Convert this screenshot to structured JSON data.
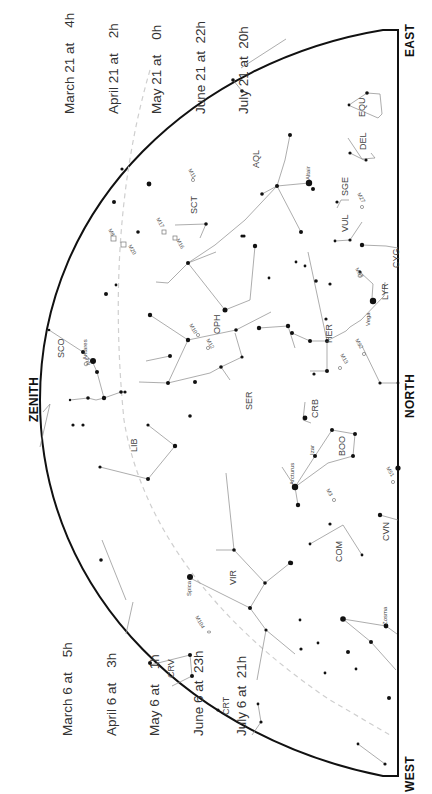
{
  "chart_title": "Star chart — south-facing summer sky (rotated)",
  "directions": {
    "zenith": "ZENITH",
    "north": "NORTH",
    "east": "EAST",
    "west": "WEST"
  },
  "time_blocks": {
    "upper": [
      "March 21 at    4h",
      "April 21 at    2h",
      "May 21 at    0h",
      "June 21 at  22h",
      "July 21 at  20h"
    ],
    "lower": [
      "March 6 at    5h",
      "April 6 at    3h",
      "May 6 at    1h",
      "June 6 at  23h",
      "July 6 at  21h"
    ]
  },
  "colors": {
    "horizon": "#111111",
    "constellation_line": "#8a8a8a",
    "star": "#111111",
    "ecliptic": "#cfcfcf",
    "label": "#444444"
  },
  "constellations": [
    {
      "abbr": "SCO",
      "x": 60,
      "y": 358
    },
    {
      "abbr": "LIB",
      "x": 137,
      "y": 445
    },
    {
      "abbr": "SCT",
      "x": 193,
      "y": 206
    },
    {
      "abbr": "OPH",
      "x": 216,
      "y": 327
    },
    {
      "abbr": "SER",
      "x": 248,
      "y": 403
    },
    {
      "abbr": "AQL",
      "x": 255,
      "y": 162
    },
    {
      "abbr": "SGE",
      "x": 346,
      "y": 200
    },
    {
      "abbr": "VUL",
      "x": 344,
      "y": 225
    },
    {
      "abbr": "DEL",
      "x": 362,
      "y": 148
    },
    {
      "abbr": "EQU",
      "x": 361,
      "y": 113
    },
    {
      "abbr": "LYR",
      "x": 384,
      "y": 295
    },
    {
      "abbr": "CYG",
      "x": 396,
      "y": 258
    },
    {
      "abbr": "HER",
      "x": 328,
      "y": 330
    },
    {
      "abbr": "CRB",
      "x": 315,
      "y": 413
    },
    {
      "abbr": "BOO",
      "x": 341,
      "y": 450
    },
    {
      "abbr": "COM",
      "x": 338,
      "y": 555
    },
    {
      "abbr": "CVN",
      "x": 385,
      "y": 535
    },
    {
      "abbr": "VIR",
      "x": 232,
      "y": 580
    },
    {
      "abbr": "CRV",
      "x": 170,
      "y": 672
    },
    {
      "abbr": "CRT",
      "x": 225,
      "y": 708
    }
  ],
  "named_stars": [
    {
      "name": "Antares",
      "x": 84,
      "y": 355
    },
    {
      "name": "Altair",
      "x": 310,
      "y": 172
    },
    {
      "name": "Vega",
      "x": 372,
      "y": 313
    },
    {
      "name": "Arcturus",
      "x": 291,
      "y": 468
    },
    {
      "name": "Izar",
      "x": 311,
      "y": 450
    },
    {
      "name": "Spica",
      "x": 186,
      "y": 583
    },
    {
      "name": "Zosma",
      "x": 386,
      "y": 608
    }
  ],
  "deep_sky_objects": [
    {
      "id": "M4",
      "x": 86,
      "y": 362
    },
    {
      "id": "M8",
      "x": 112,
      "y": 232
    },
    {
      "id": "M20",
      "x": 128,
      "y": 248
    },
    {
      "id": "M17",
      "x": 162,
      "y": 227
    },
    {
      "id": "M16",
      "x": 178,
      "y": 237
    },
    {
      "id": "M11",
      "x": 196,
      "y": 180
    },
    {
      "id": "M10",
      "x": 195,
      "y": 330
    },
    {
      "id": "M12",
      "x": 212,
      "y": 345
    },
    {
      "id": "M13",
      "x": 342,
      "y": 357
    },
    {
      "id": "M92",
      "x": 361,
      "y": 347
    },
    {
      "id": "M57",
      "x": 362,
      "y": 278
    },
    {
      "id": "M27",
      "x": 357,
      "y": 204
    },
    {
      "id": "M3",
      "x": 331,
      "y": 496
    },
    {
      "id": "M51",
      "x": 391,
      "y": 477
    },
    {
      "id": "M104",
      "x": 201,
      "y": 628
    }
  ]
}
